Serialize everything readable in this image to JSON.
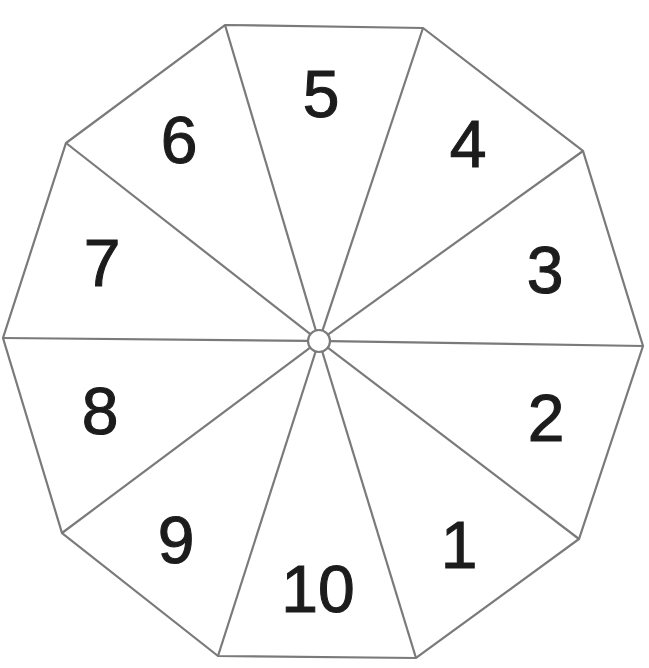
{
  "diagram": {
    "type": "decagon-spinner",
    "sector_count": 10,
    "center": {
      "x": 319,
      "y": 341,
      "hub_radius": 11
    },
    "vertices": [
      {
        "x": 225,
        "y": 25
      },
      {
        "x": 423,
        "y": 28
      },
      {
        "x": 583,
        "y": 151
      },
      {
        "x": 643,
        "y": 346
      },
      {
        "x": 579,
        "y": 539
      },
      {
        "x": 416,
        "y": 658
      },
      {
        "x": 218,
        "y": 656
      },
      {
        "x": 62,
        "y": 533
      },
      {
        "x": 3,
        "y": 338
      },
      {
        "x": 66,
        "y": 143
      }
    ],
    "sectors": [
      {
        "label": "1",
        "x": 459,
        "y": 545
      },
      {
        "label": "2",
        "x": 546,
        "y": 418
      },
      {
        "label": "3",
        "x": 545,
        "y": 270
      },
      {
        "label": "4",
        "x": 468,
        "y": 144
      },
      {
        "label": "5",
        "x": 321,
        "y": 94
      },
      {
        "label": "6",
        "x": 179,
        "y": 140
      },
      {
        "label": "7",
        "x": 102,
        "y": 263
      },
      {
        "label": "8",
        "x": 100,
        "y": 411
      },
      {
        "label": "9",
        "x": 176,
        "y": 540
      },
      {
        "label": "10",
        "x": 318,
        "y": 589
      }
    ],
    "colors": {
      "line": "#7a7a7a",
      "label": "#1c1c1c",
      "fill": "#ffffff"
    }
  }
}
